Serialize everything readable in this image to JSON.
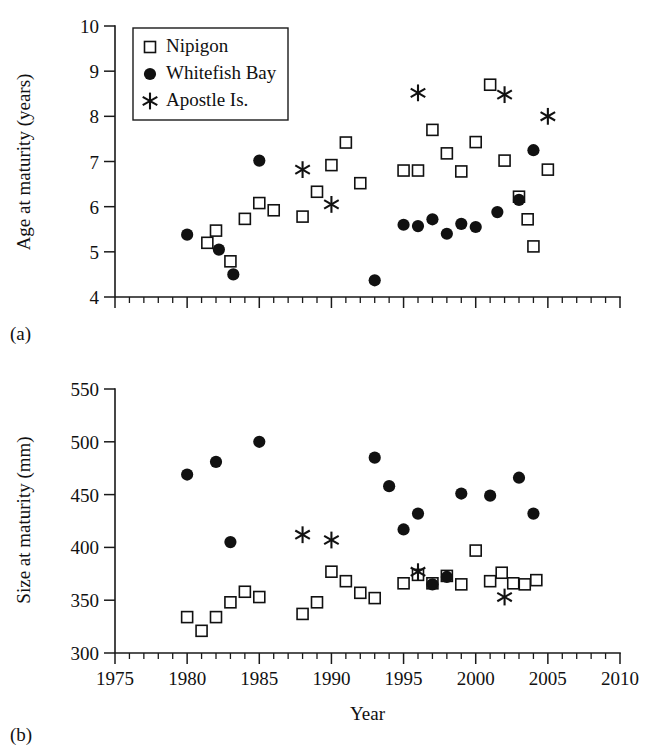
{
  "figure": {
    "panels": [
      {
        "id": "a",
        "label": "(a)",
        "ylabel": "Age at maturity (years)",
        "xlabel": ""
      },
      {
        "id": "b",
        "label": "(b)",
        "ylabel": "Size at maturity (mm)",
        "xlabel": "Year"
      }
    ]
  },
  "legend": {
    "position": "top-left-inside-panel-a",
    "entries": [
      {
        "label": "Nipigon",
        "marker": "open-square"
      },
      {
        "label": "Whitefish Bay",
        "marker": "filled-circle"
      },
      {
        "label": "Apostle Is.",
        "marker": "asterisk"
      }
    ]
  },
  "colors": {
    "ink": "#111111",
    "background": "#ffffff",
    "marker_fill_open": "#ffffff",
    "marker_fill_solid": "#111111"
  },
  "chart_data": [
    {
      "type": "scatter",
      "panel": "a",
      "title": "",
      "xlabel": "",
      "ylabel": "Age at maturity (years)",
      "xlim": [
        1975,
        2010
      ],
      "ylim": [
        4,
        10
      ],
      "xticks": [
        1975,
        1980,
        1985,
        1990,
        1995,
        2000,
        2005,
        2010
      ],
      "xtick_labels": [
        "",
        "",
        "",
        "",
        "",
        "",
        "",
        ""
      ],
      "xminor_step": 1,
      "yticks": [
        4,
        5,
        6,
        7,
        8,
        9,
        10
      ],
      "ytick_labels": [
        "4",
        "5",
        "6",
        "7",
        "8",
        "9",
        "10"
      ],
      "grid": false,
      "legend_position": "upper left",
      "series": [
        {
          "name": "Nipigon",
          "marker": "open-square",
          "points": [
            [
              1981.4,
              5.2
            ],
            [
              1982.0,
              5.47
            ],
            [
              1983.0,
              4.79
            ],
            [
              1984.0,
              5.73
            ],
            [
              1985.0,
              6.08
            ],
            [
              1986.0,
              5.92
            ],
            [
              1988.0,
              5.78
            ],
            [
              1989.0,
              6.33
            ],
            [
              1990.0,
              6.92
            ],
            [
              1991.0,
              7.42
            ],
            [
              1992.0,
              6.52
            ],
            [
              1995.0,
              6.8
            ],
            [
              1996.0,
              6.8
            ],
            [
              1997.0,
              7.7
            ],
            [
              1998.0,
              7.18
            ],
            [
              1999.0,
              6.78
            ],
            [
              2000.0,
              7.43
            ],
            [
              2001.0,
              8.7
            ],
            [
              2002.0,
              7.02
            ],
            [
              2003.0,
              6.22
            ],
            [
              2003.6,
              5.72
            ],
            [
              2004.0,
              5.12
            ],
            [
              2005.0,
              6.82
            ]
          ]
        },
        {
          "name": "Whitefish Bay",
          "marker": "filled-circle",
          "points": [
            [
              1980.0,
              5.38
            ],
            [
              1982.2,
              5.05
            ],
            [
              1983.2,
              4.5
            ],
            [
              1985.0,
              7.02
            ],
            [
              1993.0,
              4.37
            ],
            [
              1995.0,
              5.6
            ],
            [
              1996.0,
              5.57
            ],
            [
              1997.0,
              5.72
            ],
            [
              1998.0,
              5.4
            ],
            [
              1999.0,
              5.62
            ],
            [
              2000.0,
              5.55
            ],
            [
              2001.5,
              5.88
            ],
            [
              2003.0,
              6.15
            ],
            [
              2004.0,
              7.25
            ]
          ]
        },
        {
          "name": "Apostle Is.",
          "marker": "asterisk",
          "points": [
            [
              1988.0,
              6.82
            ],
            [
              1990.0,
              6.05
            ],
            [
              1996.0,
              8.52
            ],
            [
              2002.0,
              8.48
            ],
            [
              2005.0,
              8.0
            ]
          ]
        }
      ]
    },
    {
      "type": "scatter",
      "panel": "b",
      "title": "",
      "xlabel": "Year",
      "ylabel": "Size at maturity (mm)",
      "xlim": [
        1975,
        2010
      ],
      "ylim": [
        300,
        550
      ],
      "xticks": [
        1975,
        1980,
        1985,
        1990,
        1995,
        2000,
        2005,
        2010
      ],
      "xtick_labels": [
        "1975",
        "1980",
        "1985",
        "1990",
        "1995",
        "2000",
        "2005",
        "2010"
      ],
      "xminor_step": 1,
      "yticks": [
        300,
        350,
        400,
        450,
        500,
        550
      ],
      "ytick_labels": [
        "300",
        "350",
        "400",
        "450",
        "500",
        "550"
      ],
      "grid": false,
      "legend_position": "none",
      "series": [
        {
          "name": "Nipigon",
          "marker": "open-square",
          "points": [
            [
              1980.0,
              334
            ],
            [
              1981.0,
              321
            ],
            [
              1982.0,
              334
            ],
            [
              1983.0,
              348
            ],
            [
              1984.0,
              358
            ],
            [
              1985.0,
              353
            ],
            [
              1988.0,
              337
            ],
            [
              1989.0,
              348
            ],
            [
              1990.0,
              377
            ],
            [
              1991.0,
              368
            ],
            [
              1992.0,
              357
            ],
            [
              1993.0,
              352
            ],
            [
              1995.0,
              366
            ],
            [
              1996.0,
              374
            ],
            [
              1997.0,
              366
            ],
            [
              1998.0,
              373
            ],
            [
              1999.0,
              365
            ],
            [
              2000.0,
              397
            ],
            [
              2001.0,
              368
            ],
            [
              2001.8,
              376
            ],
            [
              2002.6,
              366
            ],
            [
              2003.4,
              365
            ],
            [
              2004.2,
              369
            ]
          ]
        },
        {
          "name": "Whitefish Bay",
          "marker": "filled-circle",
          "points": [
            [
              1980.0,
              469
            ],
            [
              1982.0,
              481
            ],
            [
              1983.0,
              405
            ],
            [
              1985.0,
              500
            ],
            [
              1993.0,
              485
            ],
            [
              1994.0,
              458
            ],
            [
              1995.0,
              417
            ],
            [
              1996.0,
              432
            ],
            [
              1997.0,
              365
            ],
            [
              1998.0,
              372
            ],
            [
              1999.0,
              451
            ],
            [
              2001.0,
              449
            ],
            [
              2003.0,
              466
            ],
            [
              2004.0,
              432
            ]
          ]
        },
        {
          "name": "Apostle Is.",
          "marker": "asterisk",
          "points": [
            [
              1988.0,
              412
            ],
            [
              1990.0,
              407
            ],
            [
              1996.0,
              377
            ],
            [
              2002.0,
              353
            ]
          ]
        }
      ]
    }
  ]
}
